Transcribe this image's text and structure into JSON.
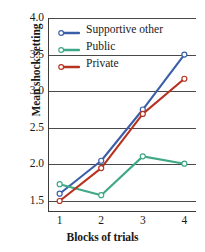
{
  "chart_data": {
    "type": "line",
    "title": "",
    "xlabel": "Blocks of trials",
    "ylabel": "Mean shock setting",
    "x": [
      1,
      2,
      3,
      4
    ],
    "xticklabels": [
      "1",
      "2",
      "3",
      "4"
    ],
    "yticklabels": [
      "1.5",
      "2.0",
      "2.5",
      "3.0",
      "3.5",
      "4.0"
    ],
    "yticks": [
      1.5,
      2.0,
      2.5,
      3.0,
      3.5,
      4.0
    ],
    "ylim": [
      1.35,
      4.0
    ],
    "xlim": [
      0.72,
      4.28
    ],
    "grid": "horizontal",
    "legend_position": "top-left-inside",
    "marker": "open-circle",
    "series": [
      {
        "name": "Supportive other",
        "color": "#3A5FA8",
        "values": [
          1.6,
          2.05,
          2.75,
          3.5
        ]
      },
      {
        "name": "Public",
        "color": "#3FA886",
        "values": [
          1.73,
          1.58,
          2.11,
          2.01
        ]
      },
      {
        "name": "Private",
        "color": "#B7331F",
        "values": [
          1.5,
          1.95,
          2.69,
          3.17
        ]
      }
    ]
  },
  "axes": {
    "y_title": "Mean shock setting",
    "x_title": "Blocks of trials",
    "y_tick_0": "1.5",
    "y_tick_1": "2.0",
    "y_tick_2": "2.5",
    "y_tick_3": "3.0",
    "y_tick_4": "3.5",
    "y_tick_5": "4.0",
    "x_tick_0": "1",
    "x_tick_1": "2",
    "x_tick_2": "3",
    "x_tick_3": "4"
  },
  "legend": {
    "items": [
      {
        "label": "Supportive other",
        "color": "#3A5FA8"
      },
      {
        "label": "Public",
        "color": "#3FA886"
      },
      {
        "label": "Private",
        "color": "#B7331F"
      }
    ]
  },
  "colors": {
    "supportive_other": "#3A5FA8",
    "public": "#3FA886",
    "private": "#B7331F",
    "axis": "#3a3a3a",
    "grid": "#4a4a4a",
    "text": "#1a1a1a",
    "background": "#ffffff"
  }
}
